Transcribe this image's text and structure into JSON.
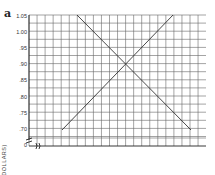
{
  "panel_label": "a",
  "chart_data": {
    "type": "line",
    "title": "",
    "xlabel": "",
    "ylabel": "(DOLLARS)",
    "yticks": [
      "1.05",
      "1.00",
      ".95",
      ".90",
      ".85",
      ".80",
      ".75",
      ".70",
      "0"
    ],
    "ylim": [
      0.7,
      1.05
    ],
    "axis_break": true,
    "grid": true,
    "series": [
      {
        "name": "upward-sloping line",
        "x": [
          4,
          18
        ],
        "y": [
          0.7,
          1.05
        ]
      },
      {
        "name": "downward-sloping line",
        "x": [
          6,
          20
        ],
        "y": [
          1.05,
          0.7
        ]
      }
    ],
    "intersection": {
      "x": 12,
      "y": 0.9
    }
  },
  "colors": {
    "grid": "#555555",
    "line": "#333333",
    "background": "#ffffff"
  }
}
